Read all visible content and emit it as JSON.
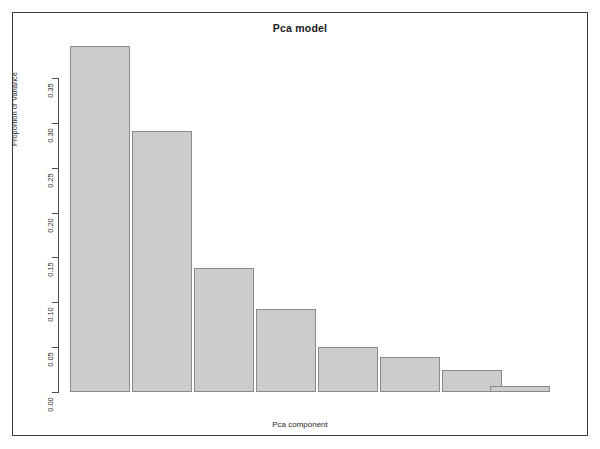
{
  "figure": {
    "title": "Pca model",
    "xlabel": "Pca component",
    "ylabel": "Proportion of Variance",
    "bar_fill_color": "#cccccc",
    "bar_border_color": "#8a8a8a",
    "axis_color": "#4d4d4d",
    "frame_color": "#3a3a3a",
    "background_color": "#ffffff"
  },
  "axis": {
    "y_tick_labels": [
      "0.00",
      "0.05",
      "0.10",
      "0.15",
      "0.20",
      "0.25",
      "0.30",
      "0.35"
    ],
    "y_tick_values": [
      0.0,
      0.05,
      0.1,
      0.15,
      0.2,
      0.25,
      0.3,
      0.35
    ],
    "x_tick_labels": []
  },
  "chart_data": {
    "type": "bar",
    "title": "Pca model",
    "xlabel": "Pca component",
    "ylabel": "Proportion of Variance",
    "categories": [
      "1",
      "2",
      "3",
      "4",
      "5",
      "6",
      "7",
      "8"
    ],
    "values": [
      0.386,
      0.291,
      0.138,
      0.093,
      0.05,
      0.039,
      0.025,
      0.007
    ],
    "ylim": [
      0.0,
      0.386
    ],
    "yticks": [
      0.0,
      0.05,
      0.1,
      0.15,
      0.2,
      0.25,
      0.3,
      0.35
    ],
    "ytick_labels": [
      "0.00",
      "0.05",
      "0.10",
      "0.15",
      "0.20",
      "0.25",
      "0.30",
      "0.35"
    ],
    "xticks": [],
    "grid": false,
    "legend": null,
    "bar_color": "#cccccc",
    "bar_edge_color": "#8a8a8a",
    "orientation": "vertical"
  },
  "layout": {
    "plot_left_px": 58,
    "plot_baseline_px": 392,
    "plot_top_px": 46,
    "bar_width_px": 60,
    "bar_gap_px": 0,
    "bar_x_positions": [
      70,
      132,
      194,
      256,
      318,
      380,
      442,
      490
    ],
    "y_scale_top_value": 0.35,
    "y_scale_top_px": 78
  }
}
